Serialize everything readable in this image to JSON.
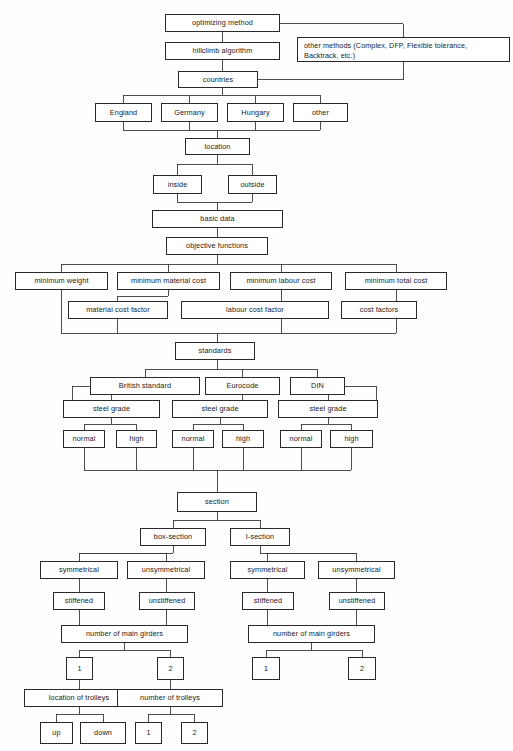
{
  "diagram": {
    "type": "flowchart-tree",
    "background_color": "#fefefe",
    "box_border_color": "#2a2a2a",
    "box_fill_color": "#ffffff",
    "connector_color": "#3a3a3a"
  },
  "nodes": {
    "optimizing_method": "optimizing method",
    "other_methods": "other methods (Complex, DFP, Flexible tolerance, Backtrack, etc.)",
    "hillclimb_algorithm": "hillclimb algorithm",
    "countries": "countries",
    "england": "England",
    "germany": "Germany",
    "hungary": "Hungary",
    "other_country": "other",
    "location": "location",
    "inside": "inside",
    "outside": "outside",
    "basic_data": "basic data",
    "objective_functions": "objective functions",
    "minimum_weight": "minimum weight",
    "minimum_material_cost": "minimum material cost",
    "minimum_labour_cost": "minimum labour cost",
    "minimum_total_cost": "minimum total cost",
    "material_cost_factor": "material cost factor",
    "labour_cost_factor": "labour cost factor",
    "cost_factors": "cost factors",
    "standards": "standards",
    "british_standard": "British standard",
    "eurocode": "Eurocode",
    "din": "DIN",
    "steel_grade_bs": "steel grade",
    "steel_grade_ec": "steel grade",
    "steel_grade_din": "steel grade",
    "normal_bs": "normal",
    "high_bs": "high",
    "normal_ec": "normal",
    "high_ec": "high",
    "normal_din": "normal",
    "high_din": "high",
    "section": "section",
    "box_section": "box-section",
    "i_section": "I-section",
    "symmetrical_box": "symmetrical",
    "unsymmetrical_box": "unsymmetrical",
    "symmetrical_i": "symmetrical",
    "unsymmetrical_i": "unsymmetrical",
    "stiffened_box": "stiffened",
    "unstiffened_box": "unstiffened",
    "stiffened_i": "stiffened",
    "unstiffened_i": "unstiffened",
    "girders_box": "number of main girders",
    "girders_i": "number of main girders",
    "girders_box_1": "1",
    "girders_box_2": "2",
    "girders_i_1": "1",
    "girders_i_2": "2",
    "location_of_trolleys": "location of trolleys",
    "number_of_trolleys": "number of trolleys",
    "trolley_up": "up",
    "trolley_down": "down",
    "trolleys_1": "1",
    "trolleys_2": "2"
  }
}
